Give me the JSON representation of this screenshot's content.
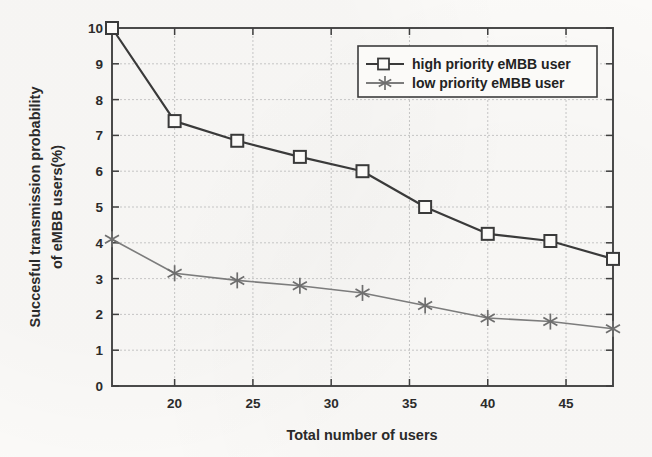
{
  "figure": {
    "background_color": "#fbfaf8",
    "plot_border_color": "#4a4a4a"
  },
  "chart_data": {
    "type": "line",
    "title": "",
    "xlabel": "Total number of users",
    "ylabel": "Succesful transmission probability of eMBB users(%)",
    "ylabel_line1": "Succesful transmission probability",
    "ylabel_line2": "of eMBB users(%)",
    "x": [
      16,
      20,
      24,
      28,
      32,
      36,
      40,
      44,
      48
    ],
    "xlim": [
      16,
      48
    ],
    "ylim": [
      0,
      10
    ],
    "xticks": [
      20,
      25,
      30,
      35,
      40,
      45
    ],
    "xtick_labels": [
      "20",
      "25",
      "30",
      "35",
      "40",
      "45"
    ],
    "yticks": [
      0,
      1,
      2,
      3,
      4,
      5,
      6,
      7,
      8,
      9,
      10
    ],
    "ytick_labels": [
      "0",
      "1",
      "2",
      "3",
      "4",
      "5",
      "6",
      "7",
      "8",
      "9",
      "10"
    ],
    "grid": true,
    "legend_position": "upper right",
    "series": [
      {
        "name": "high priority eMBB user",
        "marker": "square",
        "color": "#3a3a3a",
        "values": [
          10.0,
          7.4,
          6.85,
          6.4,
          6.0,
          5.0,
          4.25,
          4.05,
          3.55
        ]
      },
      {
        "name": "low priority eMBB user",
        "marker": "asterisk",
        "color": "#7c7c7c",
        "values": [
          4.1,
          3.15,
          2.95,
          2.8,
          2.6,
          2.25,
          1.9,
          1.8,
          1.6
        ]
      }
    ]
  },
  "legend": {
    "entries": [
      {
        "label": "high priority eMBB user"
      },
      {
        "label": "low priority eMBB user"
      }
    ]
  }
}
